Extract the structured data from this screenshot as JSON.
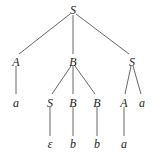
{
  "diagram": {
    "type": "parse-tree",
    "nodes": [
      {
        "id": "n0",
        "label": "S",
        "x": 73,
        "y": 10
      },
      {
        "id": "n1",
        "label": "A",
        "x": 16,
        "y": 62
      },
      {
        "id": "n2",
        "label": "B",
        "x": 73,
        "y": 62
      },
      {
        "id": "n3",
        "label": "S",
        "x": 132,
        "y": 62
      },
      {
        "id": "n4",
        "label": "a",
        "x": 16,
        "y": 103
      },
      {
        "id": "n5",
        "label": "S",
        "x": 50,
        "y": 103
      },
      {
        "id": "n6",
        "label": "B",
        "x": 73,
        "y": 103
      },
      {
        "id": "n7",
        "label": "B",
        "x": 97,
        "y": 103
      },
      {
        "id": "n8",
        "label": "A",
        "x": 124,
        "y": 103
      },
      {
        "id": "n9",
        "label": "a",
        "x": 142,
        "y": 103
      },
      {
        "id": "n10",
        "label": "ε",
        "x": 50,
        "y": 144
      },
      {
        "id": "n11",
        "label": "b",
        "x": 73,
        "y": 144
      },
      {
        "id": "n12",
        "label": "b",
        "x": 97,
        "y": 144
      },
      {
        "id": "n13",
        "label": "a",
        "x": 124,
        "y": 144
      }
    ],
    "edges": [
      {
        "from": "n0",
        "to": "n1",
        "x1": 70,
        "y1": 14,
        "x2": 19,
        "y2": 54
      },
      {
        "from": "n0",
        "to": "n2",
        "x1": 73,
        "y1": 15,
        "x2": 73,
        "y2": 54
      },
      {
        "from": "n0",
        "to": "n3",
        "x1": 76,
        "y1": 14,
        "x2": 129,
        "y2": 54
      },
      {
        "from": "n1",
        "to": "n4",
        "x1": 16,
        "y1": 66,
        "x2": 16,
        "y2": 94
      },
      {
        "from": "n2",
        "to": "n5",
        "x1": 71,
        "y1": 66,
        "x2": 52,
        "y2": 94
      },
      {
        "from": "n2",
        "to": "n6",
        "x1": 73,
        "y1": 66,
        "x2": 73,
        "y2": 94
      },
      {
        "from": "n2",
        "to": "n7",
        "x1": 75,
        "y1": 66,
        "x2": 95,
        "y2": 94
      },
      {
        "from": "n3",
        "to": "n8",
        "x1": 131,
        "y1": 66,
        "x2": 125,
        "y2": 94
      },
      {
        "from": "n3",
        "to": "n9",
        "x1": 133,
        "y1": 66,
        "x2": 141,
        "y2": 94
      },
      {
        "from": "n5",
        "to": "n10",
        "x1": 50,
        "y1": 107,
        "x2": 50,
        "y2": 136
      },
      {
        "from": "n6",
        "to": "n11",
        "x1": 73,
        "y1": 107,
        "x2": 73,
        "y2": 136
      },
      {
        "from": "n7",
        "to": "n12",
        "x1": 97,
        "y1": 107,
        "x2": 97,
        "y2": 136
      },
      {
        "from": "n8",
        "to": "n13",
        "x1": 124,
        "y1": 107,
        "x2": 124,
        "y2": 136
      }
    ]
  }
}
